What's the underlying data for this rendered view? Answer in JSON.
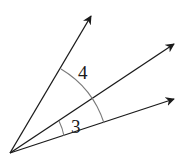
{
  "diagram": {
    "type": "angles-from-common-vertex",
    "vertex": {
      "x": 10,
      "y": 153
    },
    "rays": [
      {
        "id": "ray-top",
        "tip": {
          "x": 91,
          "y": 16
        }
      },
      {
        "id": "ray-middle",
        "tip": {
          "x": 174,
          "y": 44
        }
      },
      {
        "id": "ray-bottom",
        "tip": {
          "x": 174,
          "y": 99
        }
      }
    ],
    "angles": [
      {
        "id": "angle-4",
        "label": "4",
        "between": [
          "ray-top",
          "ray-bottom"
        ]
      },
      {
        "id": "angle-3",
        "label": "3",
        "between": [
          "ray-middle",
          "ray-bottom"
        ]
      }
    ],
    "colors": {
      "ray": "#1a1a1a",
      "arc": "#7a7a7a",
      "background": "#ffffff"
    }
  }
}
